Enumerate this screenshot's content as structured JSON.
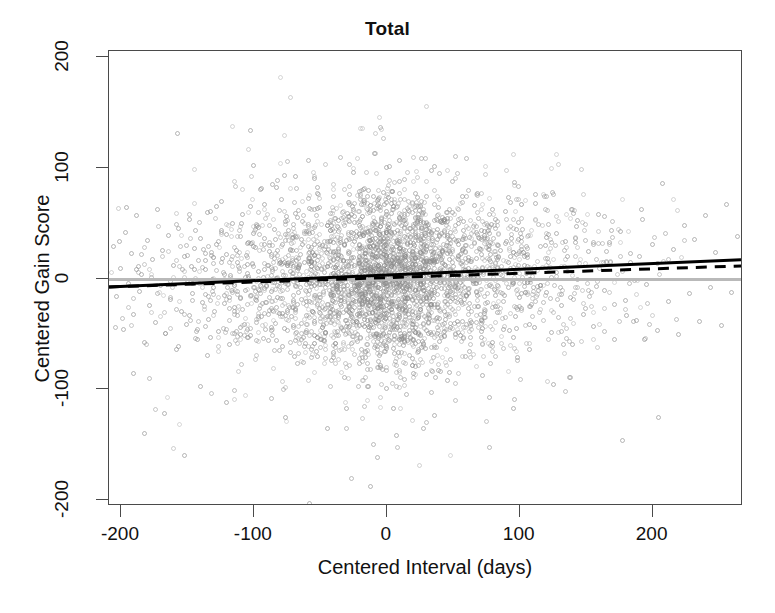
{
  "chart_data": {
    "type": "scatter",
    "title": "Total",
    "xlabel": "Centered Interval (days)",
    "ylabel": "Centered Gain Score",
    "xlim": [
      -209,
      268
    ],
    "ylim": [
      -205,
      205
    ],
    "xticks": [
      -200,
      -100,
      0,
      100,
      200
    ],
    "yticks": [
      -200,
      -100,
      0,
      100,
      200
    ],
    "xtick_labels": [
      "-200",
      "-100",
      "0",
      "100",
      "200"
    ],
    "ytick_labels": [
      "-200",
      "-100",
      "0",
      "100",
      "200"
    ],
    "grid": false,
    "legend": "none",
    "point_style": {
      "marker": "open-circle",
      "color": "#8c8c8c",
      "size": 5,
      "approx_count": 2100
    },
    "annotations": [
      {
        "name": "zero-reference-line",
        "type": "horizontal-line",
        "y": 0,
        "color": "#b9b9b9",
        "style": "solid",
        "width": 3
      },
      {
        "name": "regression-line-solid",
        "type": "line",
        "x": [
          -209,
          268
        ],
        "y": [
          -8.5,
          16.0
        ],
        "color": "#000000",
        "style": "solid",
        "width": 3,
        "slope": 0.0514,
        "intercept": 2.24
      },
      {
        "name": "regression-line-dashed",
        "type": "line",
        "x": [
          -209,
          268
        ],
        "y": [
          -8.5,
          10.5
        ],
        "color": "#000000",
        "style": "dashed",
        "width": 3,
        "slope": 0.0398,
        "intercept": -0.18
      }
    ],
    "series": [
      {
        "name": "Total gain scores",
        "note": "Points are clustered in discrete vertical day-columns; density is highest near x = 0 and thins toward both tails.",
        "points": [
          [
            -205,
            28
          ],
          [
            -203,
            -17
          ],
          [
            -200,
            9
          ],
          [
            -198,
            -46
          ],
          [
            -196,
            41
          ],
          [
            -194,
            -5
          ],
          [
            -192,
            22
          ],
          [
            -190,
            -33
          ],
          [
            -188,
            56
          ],
          [
            -186,
            -12
          ],
          [
            -184,
            3
          ],
          [
            -182,
            -58
          ],
          [
            -180,
            34
          ],
          [
            -178,
            -25
          ],
          [
            -176,
            17
          ],
          [
            -174,
            -40
          ],
          [
            -172,
            62
          ],
          [
            -170,
            -7
          ],
          [
            -168,
            25
          ],
          [
            -166,
            -50
          ],
          [
            -164,
            38
          ],
          [
            -162,
            -19
          ],
          [
            -160,
            11
          ],
          [
            -158,
            -64
          ],
          [
            -157,
            130
          ],
          [
            -156,
            45
          ],
          [
            -154,
            -30
          ],
          [
            -152,
            19
          ],
          [
            -150,
            -42
          ],
          [
            -148,
            53
          ],
          [
            -146,
            -14
          ],
          [
            -144,
            27
          ],
          [
            -142,
            -55
          ],
          [
            -140,
            36
          ],
          [
            -138,
            -22
          ],
          [
            -136,
            8
          ],
          [
            -134,
            -37
          ],
          [
            -132,
            60
          ],
          [
            -130,
            -9
          ],
          [
            -128,
            30
          ],
          [
            -126,
            -48
          ],
          [
            -124,
            43
          ],
          [
            -122,
            -16
          ],
          [
            -120,
            21
          ],
          [
            -118,
            -60
          ],
          [
            -116,
            49
          ],
          [
            -114,
            -27
          ],
          [
            -112,
            14
          ],
          [
            -110,
            -45
          ],
          [
            -108,
            57
          ],
          [
            -106,
            -11
          ],
          [
            -104,
            32
          ],
          [
            -102,
            -52
          ],
          [
            -100,
            40
          ],
          [
            -98,
            -20
          ],
          [
            -96,
            6
          ],
          [
            -95,
            80
          ],
          [
            -94,
            -35
          ],
          [
            -92,
            66
          ],
          [
            -90,
            -8
          ],
          [
            -88,
            24
          ],
          [
            -86,
            -47
          ],
          [
            -84,
            44
          ],
          [
            -82,
            -18
          ],
          [
            -80,
            13
          ],
          [
            -78,
            -62
          ],
          [
            -76,
            51
          ],
          [
            -74,
            -29
          ],
          [
            -72,
            26
          ],
          [
            -70,
            -43
          ],
          [
            -68,
            58
          ],
          [
            -66,
            -13
          ],
          [
            -64,
            35
          ],
          [
            -62,
            -54
          ],
          [
            -60,
            42
          ],
          [
            -58,
            -21
          ],
          [
            -56,
            10
          ],
          [
            -54,
            -39
          ],
          [
            -52,
            63
          ],
          [
            -50,
            -6
          ],
          [
            -48,
            29
          ],
          [
            -46,
            -49
          ],
          [
            -44,
            47
          ],
          [
            -42,
            -15
          ],
          [
            -40,
            23
          ],
          [
            -38,
            -59
          ],
          [
            -36,
            52
          ],
          [
            -34,
            -26
          ],
          [
            -32,
            16
          ],
          [
            -30,
            -44
          ],
          [
            -28,
            55
          ],
          [
            -26,
            -10
          ],
          [
            -25,
            95
          ],
          [
            -24,
            33
          ],
          [
            -22,
            -51
          ],
          [
            -20,
            39
          ],
          [
            -18,
            -23
          ],
          [
            -16,
            7
          ],
          [
            -14,
            -38
          ],
          [
            -12,
            61
          ],
          [
            -10,
            -4
          ],
          [
            -9,
            112
          ],
          [
            -8,
            31
          ],
          [
            -6,
            -53
          ],
          [
            -4,
            46
          ],
          [
            -2,
            -17
          ],
          [
            0,
            20
          ],
          [
            0,
            100
          ],
          [
            0,
            -100
          ],
          [
            0,
            68
          ],
          [
            0,
            -62
          ],
          [
            2,
            48
          ],
          [
            4,
            -28
          ],
          [
            6,
            18
          ],
          [
            8,
            -41
          ],
          [
            10,
            54
          ],
          [
            12,
            -12
          ],
          [
            14,
            37
          ],
          [
            16,
            -56
          ],
          [
            18,
            45
          ],
          [
            20,
            -19
          ],
          [
            22,
            12
          ],
          [
            24,
            -36
          ],
          [
            26,
            64
          ],
          [
            28,
            -3
          ],
          [
            30,
            28
          ],
          [
            32,
            -50
          ],
          [
            34,
            41
          ],
          [
            36,
            -24
          ],
          [
            38,
            15
          ],
          [
            40,
            -57
          ],
          [
            42,
            50
          ],
          [
            44,
            -30
          ],
          [
            46,
            22
          ],
          [
            48,
            -45
          ],
          [
            50,
            59
          ],
          [
            52,
            -8
          ],
          [
            54,
            34
          ],
          [
            56,
            -52
          ],
          [
            58,
            43
          ],
          [
            60,
            -16
          ],
          [
            62,
            9
          ],
          [
            64,
            -40
          ],
          [
            66,
            65
          ],
          [
            68,
            -5
          ],
          [
            70,
            27
          ],
          [
            72,
            -48
          ],
          [
            74,
            38
          ],
          [
            76,
            -22
          ],
          [
            78,
            17
          ],
          [
            80,
            -58
          ],
          [
            82,
            53
          ],
          [
            84,
            -31
          ],
          [
            86,
            25
          ],
          [
            88,
            -46
          ],
          [
            90,
            60
          ],
          [
            92,
            -9
          ],
          [
            94,
            36
          ],
          [
            96,
            -54
          ],
          [
            98,
            44
          ],
          [
            100,
            -18
          ],
          [
            104,
            11
          ],
          [
            108,
            -42
          ],
          [
            112,
            67
          ],
          [
            116,
            -7
          ],
          [
            120,
            29
          ],
          [
            124,
            -49
          ],
          [
            128,
            40
          ],
          [
            132,
            -25
          ],
          [
            136,
            19
          ],
          [
            140,
            -60
          ],
          [
            144,
            52
          ],
          [
            148,
            -33
          ],
          [
            152,
            24
          ],
          [
            156,
            -44
          ],
          [
            160,
            57
          ],
          [
            164,
            -11
          ],
          [
            168,
            32
          ],
          [
            172,
            -55
          ],
          [
            176,
            42
          ],
          [
            180,
            -20
          ],
          [
            184,
            14
          ],
          [
            188,
            -38
          ],
          [
            192,
            62
          ],
          [
            196,
            -6
          ],
          [
            200,
            30
          ],
          [
            204,
            -47
          ],
          [
            208,
            85
          ],
          [
            212,
            -21
          ],
          [
            216,
            26
          ],
          [
            220,
            -51
          ],
          [
            224,
            47
          ],
          [
            228,
            -14
          ],
          [
            232,
            35
          ],
          [
            236,
            -39
          ],
          [
            240,
            56
          ],
          [
            244,
            -9
          ],
          [
            248,
            23
          ],
          [
            252,
            -43
          ],
          [
            256,
            66
          ],
          [
            260,
            -13
          ],
          [
            264,
            37
          ],
          [
            -182,
            -140
          ],
          [
            -167,
            -122
          ],
          [
            -152,
            -160
          ],
          [
            -58,
            -203
          ],
          [
            -12,
            -188
          ],
          [
            -30,
            -118
          ],
          [
            46,
            -92
          ],
          [
            78,
            -108
          ],
          [
            126,
            -96
          ],
          [
            205,
            -126
          ],
          [
            178,
            -146
          ],
          [
            -190,
            -86
          ],
          [
            -140,
            -98
          ],
          [
            -120,
            -112
          ],
          [
            -76,
            -126
          ],
          [
            -44,
            -136
          ],
          [
            8,
            -142
          ],
          [
            36,
            -124
          ],
          [
            96,
            -118
          ],
          [
            380,
            0
          ]
        ]
      }
    ]
  },
  "axes": {
    "title": "Total",
    "y_axis_label": "Centered Gain Score",
    "x_axis_label": "Centered Interval (days)"
  }
}
